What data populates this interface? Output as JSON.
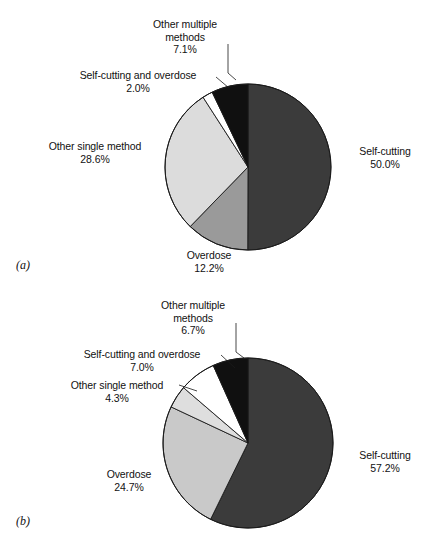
{
  "figure": {
    "background": "#ffffff",
    "width": 427,
    "height": 557
  },
  "panels": [
    {
      "tag": "(a)",
      "tag_x": 16,
      "tag_y": 258,
      "chart_data": {
        "type": "pie",
        "title": "",
        "categories": [
          "Self-cutting",
          "Overdose",
          "Other single method",
          "Self-cutting and overdose",
          "Other multiple methods"
        ],
        "values": [
          50.0,
          12.2,
          28.6,
          2.0,
          7.1
        ],
        "value_labels": [
          "50.0%",
          "12.2%",
          "28.6%",
          "2.0%",
          "7.1%"
        ],
        "colors": [
          "#3b3b3b",
          "#9a9a9a",
          "#dcdcdc",
          "#ffffff",
          "#101010"
        ],
        "start_angle_deg": 0,
        "direction": "clockwise",
        "center": [
          248,
          167
        ],
        "radius": 83,
        "legend": "none",
        "grid": false
      },
      "labels": [
        {
          "name": "slice-label-other-multiple-methods",
          "text_lines": [
            "Other multiple",
            "methods"
          ],
          "pct": "7.1%",
          "x": 120,
          "y": 18,
          "width": 130,
          "align": "center"
        },
        {
          "name": "slice-label-self-cutting-and-overdose",
          "text_lines": [
            "Self-cutting and overdose"
          ],
          "pct": "2.0%",
          "x": 58,
          "y": 69,
          "width": 160,
          "align": "center"
        },
        {
          "name": "slice-label-other-single-method",
          "text_lines": [
            "Other single method"
          ],
          "pct": "28.6%",
          "x": 30,
          "y": 140,
          "width": 130,
          "align": "center"
        },
        {
          "name": "slice-label-self-cutting",
          "text_lines": [
            "Self-cutting"
          ],
          "pct": "50.0%",
          "x": 348,
          "y": 145,
          "width": 74,
          "align": "center"
        },
        {
          "name": "slice-label-overdose",
          "text_lines": [
            "Overdose"
          ],
          "pct": "12.2%",
          "x": 176,
          "y": 249,
          "width": 66,
          "align": "center"
        }
      ],
      "leaders": [
        {
          "name": "leader-other-multiple-methods",
          "points": "228,44 228,73 236,80"
        },
        {
          "name": "leader-self-cutting-and-overdose",
          "points": "216,77 229,88"
        }
      ]
    },
    {
      "tag": "(b)",
      "tag_x": 16,
      "tag_y": 514,
      "chart_data": {
        "type": "pie",
        "title": "",
        "categories": [
          "Self-cutting",
          "Overdose",
          "Other single method",
          "Self-cutting and overdose",
          "Other multiple methods"
        ],
        "values": [
          57.2,
          24.7,
          4.3,
          7.0,
          6.7
        ],
        "value_labels": [
          "57.2%",
          "24.7%",
          "4.3%",
          "7.0%",
          "6.7%"
        ],
        "colors": [
          "#3b3b3b",
          "#c9c9c9",
          "#dedede",
          "#ffffff",
          "#101010"
        ],
        "start_angle_deg": 0,
        "direction": "clockwise",
        "center": [
          248,
          443
        ],
        "radius": 85,
        "legend": "none",
        "grid": false
      },
      "labels": [
        {
          "name": "slice-label-other-multiple-methods",
          "text_lines": [
            "Other multiple",
            "methods"
          ],
          "pct": "6.7%",
          "x": 128,
          "y": 299,
          "width": 130,
          "align": "center"
        },
        {
          "name": "slice-label-self-cutting-and-overdose",
          "text_lines": [
            "Self-cutting and overdose"
          ],
          "pct": "7.0%",
          "x": 62,
          "y": 348,
          "width": 160,
          "align": "center"
        },
        {
          "name": "slice-label-other-single-method",
          "text_lines": [
            "Other single method"
          ],
          "pct": "4.3%",
          "x": 52,
          "y": 379,
          "width": 130,
          "align": "center"
        },
        {
          "name": "slice-label-overdose",
          "text_lines": [
            "Overdose"
          ],
          "pct": "24.7%",
          "x": 96,
          "y": 468,
          "width": 66,
          "align": "center"
        },
        {
          "name": "slice-label-self-cutting",
          "text_lines": [
            "Self-cutting"
          ],
          "pct": "57.2%",
          "x": 348,
          "y": 449,
          "width": 74,
          "align": "center"
        }
      ],
      "leaders": [
        {
          "name": "leader-other-multiple-methods",
          "points": "236,323 236,352 244,358"
        },
        {
          "name": "leader-self-cutting-and-overdose",
          "points": "221,355 235,368"
        },
        {
          "name": "leader-other-single-method",
          "points": "179,385 197,391"
        }
      ]
    }
  ]
}
